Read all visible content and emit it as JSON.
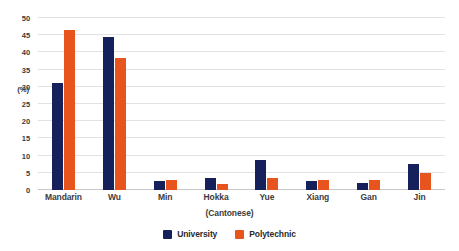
{
  "chart_data": {
    "type": "bar",
    "title": "",
    "subtitle": "",
    "xlabel": "(Cantonese)",
    "ylabel": "(%)",
    "categories": [
      "Mandarin",
      "Wu",
      "Min",
      "Hokka",
      "Yue",
      "Xiang",
      "Gan",
      "Jin"
    ],
    "series": [
      {
        "name": "University",
        "color": "#16205a",
        "values": [
          31,
          44.5,
          2.5,
          3.5,
          8.7,
          2.5,
          2,
          7.5
        ]
      },
      {
        "name": "Polytechnic",
        "color": "#e8541e",
        "values": [
          46.5,
          38.5,
          3,
          1.8,
          3.5,
          3,
          3,
          5
        ]
      }
    ],
    "ylim": [
      0,
      50
    ],
    "yticks": [
      0,
      5,
      10,
      15,
      20,
      25,
      30,
      35,
      40,
      45,
      50
    ],
    "ytick_labels": [
      "0",
      "5",
      "10",
      "15",
      "20",
      "25",
      "30",
      "35",
      "40",
      "45",
      "50"
    ],
    "grid": true,
    "grid_axis": "y",
    "legend_position": "bottom",
    "legend": [
      "University",
      "Polytechnic"
    ]
  },
  "colors": {
    "university": "#16205a",
    "polytechnic": "#e8541e",
    "gridline": "#e2e2e2",
    "axis": "#c8c8c8",
    "text": "#3c3c3c",
    "background": "#ffffff"
  }
}
